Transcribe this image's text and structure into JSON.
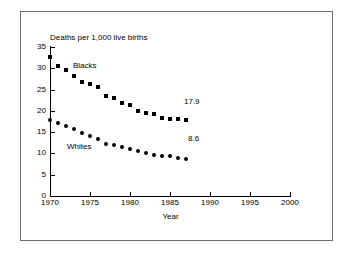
{
  "chart_data": {
    "type": "scatter",
    "title": "Deaths per 1,000 live births",
    "xlabel": "Year",
    "ylabel": "",
    "xlim": [
      1970,
      2000
    ],
    "ylim": [
      0,
      35
    ],
    "grid": false,
    "legend_position": "inline-annotation",
    "x_ticks": [
      "1970",
      "1975",
      "1980",
      "1985",
      "1990",
      "1995",
      "2000"
    ],
    "x_tick_values": [
      1970,
      1975,
      1980,
      1985,
      1990,
      1995,
      2000
    ],
    "y_ticks": [
      "0",
      "5",
      "10",
      "15",
      "20",
      "25",
      "30",
      "35"
    ],
    "y_tick_values": [
      0,
      5,
      10,
      15,
      20,
      25,
      30,
      35
    ],
    "x": [
      1970,
      1971,
      1972,
      1973,
      1974,
      1975,
      1976,
      1977,
      1978,
      1979,
      1980,
      1981,
      1982,
      1983,
      1984,
      1985,
      1986,
      1987
    ],
    "series": [
      {
        "name": "Blacks",
        "marker": "square",
        "color": "#000000",
        "values": [
          32.6,
          30.5,
          29.6,
          28.1,
          26.8,
          26.2,
          25.5,
          23.6,
          23.1,
          21.8,
          21.4,
          20.0,
          19.6,
          19.2,
          18.4,
          18.2,
          18.0,
          17.9
        ]
      },
      {
        "name": "Whites",
        "marker": "circle",
        "color": "#000000",
        "values": [
          17.8,
          17.1,
          16.4,
          15.8,
          14.8,
          14.2,
          13.3,
          12.3,
          12.0,
          11.4,
          11.0,
          10.5,
          10.1,
          9.7,
          9.4,
          9.3,
          8.9,
          8.6
        ]
      }
    ],
    "annotations": [
      {
        "name": "blacks-endpoint",
        "text": "17.9",
        "series": "Blacks",
        "x": 1987,
        "y": 17.9
      },
      {
        "name": "whites-endpoint",
        "text": "8.6",
        "series": "Whites",
        "x": 1987,
        "y": 8.6
      },
      {
        "name": "blacks-series-label",
        "text": "Blacks"
      },
      {
        "name": "whites-series-label",
        "text": "Whites"
      }
    ]
  }
}
